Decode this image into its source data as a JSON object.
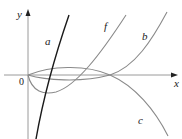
{
  "figure": {
    "axes": {
      "x_label": "x",
      "y_label": "y",
      "origin_label": "0"
    },
    "curves": [
      {
        "id": "a",
        "label": "a",
        "color": "#1a1a1a",
        "description": "steep increasing curve crossing x-axis right of origin"
      },
      {
        "id": "f",
        "label": "f",
        "color": "#8a8a8a",
        "description": "dips below x-axis from origin then rises steeply"
      },
      {
        "id": "b",
        "label": "b",
        "color": "#8a8a8a",
        "description": "slightly below x-axis, crosses near x≈ intersection, rises"
      },
      {
        "id": "c",
        "label": "c",
        "color": "#8a8a8a",
        "description": "slightly above x-axis, crosses at same point, decreases"
      }
    ],
    "colors": {
      "axis": "#9a9a9a",
      "curve_black": "#1a1a1a",
      "curve_gray": "#8a8a8a"
    }
  }
}
